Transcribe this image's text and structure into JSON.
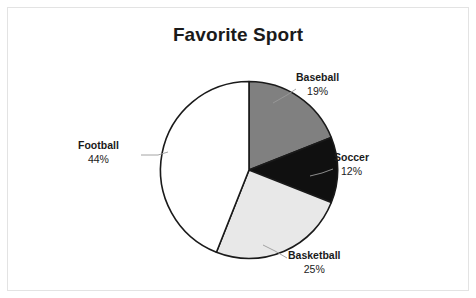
{
  "chart_data": {
    "type": "pie",
    "title": "Favorite Sport",
    "xlabel": "",
    "ylabel": "",
    "legend": "none",
    "grid": false,
    "labels_position": "outside-with-leader-lines",
    "start_angle_deg": 0,
    "direction": "clockwise",
    "categories": [
      "Baseball",
      "Soccer",
      "Basketball",
      "Football"
    ],
    "values": [
      19,
      25,
      12,
      44
    ],
    "slices": [
      {
        "name": "Baseball",
        "value": 19,
        "value_label": "19%",
        "color": "#808080",
        "outline": "#1a1a1a",
        "start_angle_deg": 0,
        "sweep_deg": 68.4
      },
      {
        "name": "Soccer",
        "value": 12,
        "value_label": "12%",
        "color": "#101010",
        "outline": "#1a1a1a",
        "start_angle_deg": 68.4,
        "sweep_deg": 43.2
      },
      {
        "name": "Basketball",
        "value": 25,
        "value_label": "25%",
        "color": "#e8e8e8",
        "outline": "#1a1a1a",
        "start_angle_deg": 111.6,
        "sweep_deg": 90.0
      },
      {
        "name": "Football",
        "value": 44,
        "value_label": "44%",
        "color": "#ffffff",
        "outline": "#1a1a1a",
        "start_angle_deg": 201.6,
        "sweep_deg": 158.4
      }
    ]
  },
  "figure": {
    "title": "Favorite Sport",
    "frame_color": "#e3e3e3",
    "background": "#ffffff",
    "leader_line_color": "#9a9a9a"
  },
  "labels": {
    "baseball": {
      "name": "Baseball",
      "value": "19%"
    },
    "soccer": {
      "name": "Soccer",
      "value": "12%"
    },
    "basketball": {
      "name": "Basketball",
      "value": "25%"
    },
    "football": {
      "name": "Football",
      "value": "44%"
    }
  }
}
